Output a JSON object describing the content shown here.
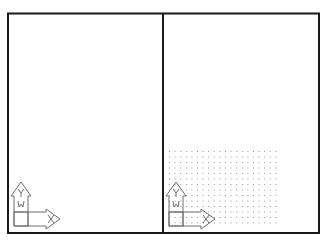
{
  "layout": {
    "type": "two-viewport-drawing-layout",
    "frame": {
      "x": 8,
      "y": 13,
      "width": 311,
      "height": 220,
      "stroke": "#1a1a1a",
      "stroke_width": 2
    },
    "divider_x": 163
  },
  "viewports": [
    {
      "id": "left",
      "grid_visible": false,
      "ucs_icon": {
        "origin_x": 14,
        "origin_y": 226,
        "labels": {
          "y": "Y",
          "w": "W",
          "x": "X"
        }
      }
    },
    {
      "id": "right",
      "grid_visible": true,
      "grid": {
        "x_start": 169,
        "y_start": 151,
        "columns": 20,
        "rows": 14,
        "spacing_x": 5.6,
        "spacing_y": 5.5,
        "dot_color": "#9a9a9a"
      },
      "ucs_icon": {
        "origin_x": 169,
        "origin_y": 226,
        "labels": {
          "y": "Y",
          "w": "W",
          "x": "X"
        }
      }
    }
  ],
  "colors": {
    "background": "#ffffff",
    "frame": "#1a1a1a",
    "icon_stroke": "#6e6e6e",
    "grid_dot": "#9a9a9a"
  }
}
